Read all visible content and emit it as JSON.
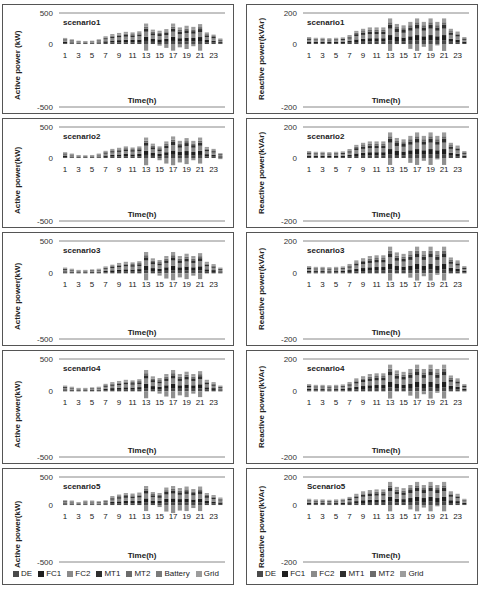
{
  "legends": {
    "active": [
      {
        "name": "DE",
        "color": "#4a4a4a"
      },
      {
        "name": "FC1",
        "color": "#1f1f1f"
      },
      {
        "name": "FC2",
        "color": "#8a8a8a"
      },
      {
        "name": "MT1",
        "color": "#2e2e2e"
      },
      {
        "name": "MT2",
        "color": "#6b6b6b"
      },
      {
        "name": "Battery",
        "color": "#7a7a7a"
      },
      {
        "name": "Grid",
        "color": "#9c9c9c"
      }
    ],
    "reactive": [
      {
        "name": "DE",
        "color": "#4a4a4a"
      },
      {
        "name": "FC1",
        "color": "#1f1f1f"
      },
      {
        "name": "FC2",
        "color": "#8a8a8a"
      },
      {
        "name": "MT1",
        "color": "#2e2e2e"
      },
      {
        "name": "MT2",
        "color": "#6b6b6b"
      },
      {
        "name": "Grid",
        "color": "#9c9c9c"
      }
    ]
  },
  "chart_data": [
    {
      "type": "bar",
      "stacked": true,
      "title": "scenario1",
      "xlabel": "Time(h)",
      "ylabel": "Active power (kW)",
      "ylim": [
        -500,
        500
      ],
      "yticks": [
        500,
        0,
        -500
      ],
      "xticks": [
        "1",
        "3",
        "5",
        "7",
        "9",
        "11",
        "13",
        "15",
        "17",
        "19",
        "21",
        "23"
      ],
      "totals": [
        110,
        85,
        60,
        55,
        60,
        85,
        140,
        180,
        200,
        220,
        210,
        230,
        370,
        260,
        240,
        270,
        370,
        300,
        330,
        310,
        360,
        210,
        170,
        100
      ],
      "negatives": [
        0,
        0,
        0,
        0,
        0,
        0,
        0,
        0,
        0,
        0,
        0,
        0,
        -120,
        0,
        -30,
        -70,
        -120,
        -60,
        -90,
        -40,
        -120,
        0,
        0,
        0
      ]
    },
    {
      "type": "bar",
      "stacked": true,
      "title": "scenario1",
      "xlabel": "Time(h)",
      "ylabel": "Reactive power(kVAr)",
      "ylim": [
        -200,
        200
      ],
      "yticks": [
        200,
        0,
        -200
      ],
      "xticks": [
        "1",
        "3",
        "5",
        "7",
        "9",
        "11",
        "13",
        "15",
        "17",
        "19",
        "21",
        "23"
      ],
      "totals": [
        50,
        45,
        45,
        42,
        45,
        48,
        65,
        95,
        110,
        120,
        120,
        120,
        185,
        145,
        135,
        160,
        185,
        160,
        185,
        160,
        185,
        110,
        90,
        50
      ],
      "negatives": [
        0,
        0,
        0,
        0,
        0,
        0,
        0,
        0,
        0,
        0,
        0,
        0,
        -50,
        0,
        0,
        -35,
        -50,
        -20,
        -50,
        -10,
        -50,
        0,
        0,
        0
      ]
    },
    {
      "type": "bar",
      "stacked": true,
      "title": "scenario2",
      "xlabel": "Time(h)",
      "ylabel": "Active power(kW)",
      "ylim": [
        -500,
        500
      ],
      "yticks": [
        500,
        0,
        -500
      ],
      "xticks": [
        "1",
        "3",
        "5",
        "7",
        "9",
        "11",
        "13",
        "15",
        "17",
        "19",
        "21",
        "23"
      ],
      "totals": [
        105,
        80,
        55,
        50,
        55,
        80,
        130,
        165,
        185,
        210,
        190,
        210,
        370,
        260,
        210,
        300,
        390,
        310,
        360,
        310,
        370,
        200,
        165,
        90
      ],
      "negatives": [
        0,
        0,
        0,
        0,
        0,
        0,
        0,
        0,
        0,
        0,
        0,
        0,
        -130,
        0,
        -40,
        -100,
        -130,
        -80,
        -110,
        -40,
        -100,
        0,
        0,
        -20
      ]
    },
    {
      "type": "bar",
      "stacked": true,
      "title": "scenario2",
      "xlabel": "Time(h)",
      "ylabel": "Reactive power(kVAr)",
      "ylim": [
        -200,
        200
      ],
      "yticks": [
        200,
        0,
        -200
      ],
      "xticks": [
        "1",
        "3",
        "5",
        "7",
        "9",
        "11",
        "13",
        "15",
        "17",
        "19",
        "21",
        "23"
      ],
      "totals": [
        50,
        45,
        45,
        42,
        45,
        48,
        65,
        95,
        110,
        120,
        120,
        120,
        185,
        145,
        135,
        160,
        185,
        160,
        185,
        160,
        185,
        110,
        90,
        50
      ],
      "negatives": [
        0,
        0,
        0,
        0,
        0,
        0,
        0,
        0,
        0,
        0,
        0,
        0,
        -50,
        0,
        0,
        -35,
        -50,
        -20,
        -50,
        -10,
        -50,
        0,
        0,
        0
      ]
    },
    {
      "type": "bar",
      "stacked": true,
      "title": "scenario3",
      "xlabel": "Time(h)",
      "ylabel": "Active power(kW)",
      "ylim": [
        -500,
        500
      ],
      "yticks": [
        500,
        0,
        -500
      ],
      "xticks": [
        "1",
        "3",
        "5",
        "7",
        "9",
        "11",
        "13",
        "15",
        "17",
        "19",
        "21",
        "23"
      ],
      "totals": [
        100,
        80,
        60,
        60,
        70,
        80,
        120,
        150,
        180,
        200,
        190,
        210,
        370,
        260,
        230,
        300,
        370,
        300,
        340,
        300,
        350,
        200,
        160,
        100
      ],
      "negatives": [
        0,
        0,
        0,
        0,
        0,
        0,
        0,
        0,
        0,
        0,
        0,
        0,
        -120,
        0,
        -40,
        -90,
        -120,
        -70,
        -100,
        -40,
        -100,
        0,
        0,
        0
      ]
    },
    {
      "type": "bar",
      "stacked": true,
      "title": "secnario3",
      "xlabel": "Time(h)",
      "ylabel": "Reactive power(kVAr)",
      "ylim": [
        -200,
        200
      ],
      "yticks": [
        200,
        0,
        -200
      ],
      "xticks": [
        "1",
        "3",
        "5",
        "7",
        "9",
        "11",
        "13",
        "15",
        "17",
        "19",
        "21",
        "23"
      ],
      "totals": [
        50,
        45,
        45,
        42,
        45,
        48,
        65,
        90,
        105,
        120,
        125,
        125,
        185,
        145,
        135,
        155,
        185,
        155,
        185,
        155,
        185,
        110,
        90,
        50
      ],
      "negatives": [
        0,
        0,
        0,
        0,
        0,
        0,
        0,
        0,
        0,
        0,
        0,
        0,
        -50,
        0,
        0,
        -30,
        -50,
        -20,
        -50,
        -10,
        -50,
        0,
        0,
        0
      ]
    },
    {
      "type": "bar",
      "stacked": true,
      "title": "scenario4",
      "xlabel": "Time(h)",
      "ylabel": "Active power(kW)",
      "ylim": [
        -500,
        500
      ],
      "yticks": [
        500,
        0,
        -500
      ],
      "xticks": [
        "1",
        "3",
        "5",
        "7",
        "9",
        "11",
        "13",
        "15",
        "17",
        "19",
        "21",
        "23"
      ],
      "totals": [
        100,
        80,
        60,
        60,
        70,
        80,
        130,
        160,
        180,
        200,
        190,
        210,
        370,
        260,
        230,
        300,
        370,
        300,
        340,
        300,
        350,
        200,
        160,
        100
      ],
      "negatives": [
        0,
        0,
        0,
        0,
        0,
        0,
        0,
        0,
        0,
        0,
        0,
        0,
        -120,
        0,
        -40,
        -90,
        -120,
        -70,
        -100,
        -40,
        -100,
        0,
        0,
        0
      ]
    },
    {
      "type": "bar",
      "stacked": true,
      "title": "secnario4",
      "xlabel": "Time(h)",
      "ylabel": "Reactive power(kVAr)",
      "ylim": [
        -200,
        200
      ],
      "yticks": [
        200,
        0,
        -200
      ],
      "xticks": [
        "1",
        "3",
        "5",
        "7",
        "9",
        "11",
        "13",
        "15",
        "17",
        "19",
        "21",
        "23"
      ],
      "totals": [
        50,
        45,
        45,
        42,
        45,
        48,
        65,
        90,
        105,
        120,
        125,
        125,
        185,
        145,
        135,
        155,
        185,
        155,
        185,
        155,
        185,
        110,
        90,
        50
      ],
      "negatives": [
        0,
        0,
        0,
        0,
        0,
        0,
        0,
        0,
        0,
        0,
        0,
        0,
        -50,
        0,
        0,
        -30,
        -50,
        -20,
        -50,
        -10,
        -50,
        0,
        0,
        0
      ]
    },
    {
      "type": "bar",
      "stacked": true,
      "title": "scenario5",
      "xlabel": "Time(h)",
      "ylabel": "Active power(kW)",
      "ylim": [
        -500,
        500
      ],
      "yticks": [
        500,
        0,
        -500
      ],
      "xticks": [
        "1",
        "3",
        "5",
        "7",
        "9",
        "11",
        "13",
        "15",
        "17",
        "19",
        "21",
        "23"
      ],
      "totals": [
        100,
        90,
        60,
        90,
        90,
        80,
        100,
        180,
        210,
        240,
        230,
        250,
        380,
        260,
        240,
        350,
        380,
        340,
        370,
        320,
        370,
        240,
        200,
        150
      ],
      "negatives": [
        0,
        0,
        0,
        0,
        0,
        0,
        0,
        0,
        0,
        0,
        0,
        0,
        -120,
        0,
        -40,
        -130,
        -160,
        -110,
        -120,
        -60,
        -120,
        0,
        0,
        0
      ]
    },
    {
      "type": "bar",
      "stacked": true,
      "title": "Scenario5",
      "xlabel": "Time(h)",
      "ylabel": "Reactive power(kVAr)",
      "ylim": [
        -200,
        200
      ],
      "yticks": [
        200,
        0,
        -200
      ],
      "xticks": [
        "1",
        "3",
        "5",
        "7",
        "9",
        "11",
        "13",
        "15",
        "17",
        "19",
        "21",
        "23"
      ],
      "totals": [
        50,
        45,
        45,
        42,
        45,
        50,
        65,
        90,
        110,
        120,
        125,
        125,
        185,
        145,
        135,
        160,
        185,
        160,
        185,
        160,
        185,
        110,
        90,
        50
      ],
      "negatives": [
        0,
        0,
        0,
        0,
        0,
        0,
        0,
        0,
        0,
        0,
        0,
        0,
        -50,
        0,
        0,
        -35,
        -50,
        -20,
        -50,
        -10,
        -50,
        0,
        0,
        0
      ]
    }
  ]
}
